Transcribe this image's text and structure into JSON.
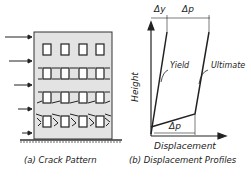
{
  "panel_a": {
    "caption": "(a) Crack Pattern",
    "floors": 4,
    "windows_per_floor": 4,
    "lateral_load_arrows": 5
  },
  "panel_b": {
    "caption": "(b) Displacement Profiles",
    "x_axis_label": "Displacement",
    "y_axis_label": "Height",
    "curves": [
      {
        "name": "Yield"
      },
      {
        "name": "Ultimate"
      }
    ],
    "dimension_top_left": "Δy",
    "dimension_top_right": "Δp",
    "dimension_bottom": "Δp"
  },
  "colors": {
    "ink": "#222222",
    "wall": "#e3e3e3"
  }
}
